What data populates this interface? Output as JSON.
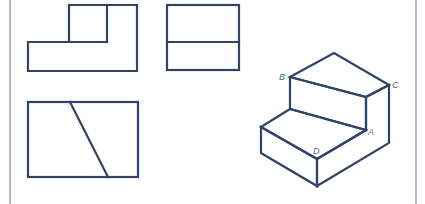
{
  "figure": {
    "stroke_color": "#2f4468",
    "frame_color": "#7d8ca3",
    "frame": {
      "left_x": 10,
      "right_x": 416
    },
    "views": {
      "front_view": {
        "name": "Front view",
        "outline": [
          [
            28,
            71
          ],
          [
            28,
            42
          ],
          [
            69,
            42
          ],
          [
            69,
            5
          ],
          [
            137,
            5
          ],
          [
            137,
            71
          ]
        ],
        "inner_lines": [
          [
            [
              107,
              5
            ],
            [
              107,
              42
            ]
          ],
          [
            [
              69,
              42
            ],
            [
              107,
              42
            ]
          ]
        ]
      },
      "side_view": {
        "name": "Side view",
        "rect": {
          "x": 167,
          "y": 5,
          "w": 72,
          "h": 65
        },
        "inner_lines": [
          [
            [
              167,
              42
            ],
            [
              239,
              42
            ]
          ]
        ]
      },
      "top_view": {
        "name": "Top view",
        "rect": {
          "x": 28,
          "y": 102,
          "w": 110,
          "h": 75
        },
        "inner_lines": [
          [
            [
              70,
              102
            ],
            [
              108,
              177
            ]
          ]
        ]
      },
      "isometric_view": {
        "name": "Isometric view",
        "vertices": {
          "apex": [
            334,
            53
          ],
          "B": [
            290,
            77
          ],
          "C": [
            389,
            85
          ],
          "inner_top": [
            366,
            97
          ],
          "A": [
            366,
            130
          ],
          "step_left": [
            290,
            109
          ],
          "left_outer": [
            261,
            127
          ],
          "D": [
            317,
            159
          ],
          "bottom": [
            317,
            186
          ],
          "left_bottom": [
            261,
            153
          ],
          "C_bottom": [
            389,
            143
          ]
        }
      }
    },
    "labels": {
      "A": "A",
      "B": "B",
      "C": "C",
      "D": "D"
    }
  }
}
